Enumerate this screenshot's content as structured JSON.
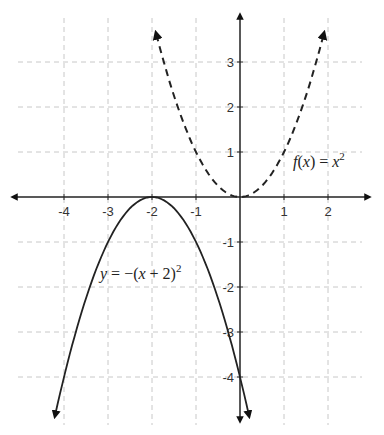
{
  "chart_data": {
    "type": "line",
    "title": "",
    "xlabel": "",
    "ylabel": "",
    "xlim": [
      -4.6,
      2.7
    ],
    "ylim": [
      -4.6,
      3.7
    ],
    "grid": true,
    "grid_style": "dashed",
    "x_ticks": [
      "-4",
      "-3",
      "-2",
      "-1",
      "1",
      "2"
    ],
    "y_ticks": [
      "3",
      "2",
      "1",
      "-1",
      "-2",
      "-3",
      "-4"
    ],
    "series": [
      {
        "name": "f(x) = x²",
        "label": "f(x) = x²",
        "style": "dashed",
        "formula": "x^2",
        "x": [
          -1.9,
          -1.5,
          -1,
          -0.5,
          0,
          0.5,
          1,
          1.5,
          1.9
        ],
        "y": [
          3.61,
          2.25,
          1,
          0.25,
          0,
          0.25,
          1,
          2.25,
          3.61
        ]
      },
      {
        "name": "y = −(x + 2)²",
        "label": "y = −(x + 2)²",
        "style": "solid",
        "formula": "-(x+2)^2",
        "x": [
          -4.2,
          -4,
          -3,
          -2,
          -1,
          0,
          0.2
        ],
        "y": [
          -4.84,
          -4,
          -1,
          0,
          -1,
          -4,
          -4.84
        ]
      }
    ],
    "annotations": [
      {
        "text": "f(x) = x²",
        "near_series": 0
      },
      {
        "text": "y = −(x + 2)²",
        "near_series": 1
      }
    ]
  },
  "labels": {
    "f": {
      "fx": "f",
      "paren_open": "(",
      "x": "x",
      "paren_close": ")",
      "eq": " = ",
      "rhs": "x",
      "sup": "2"
    },
    "g": {
      "y": "y",
      "eq": " = −(",
      "x": "x",
      "rest": " + 2)",
      "sup": "2"
    }
  }
}
